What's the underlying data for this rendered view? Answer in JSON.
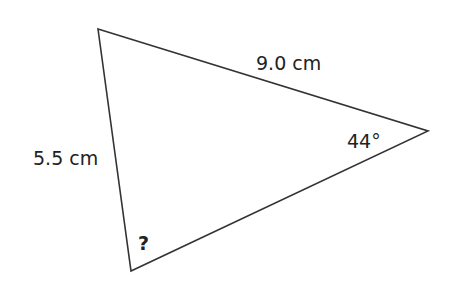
{
  "diagram": {
    "type": "triangle",
    "vertices": {
      "top": [
        98,
        29
      ],
      "right": [
        428,
        131
      ],
      "bottom": [
        131,
        271
      ]
    },
    "stroke_color": "#333333",
    "labels": {
      "side_top": "9.0 cm",
      "side_left": "5.5 cm",
      "angle_right": "44°",
      "angle_bottom": "?"
    }
  }
}
